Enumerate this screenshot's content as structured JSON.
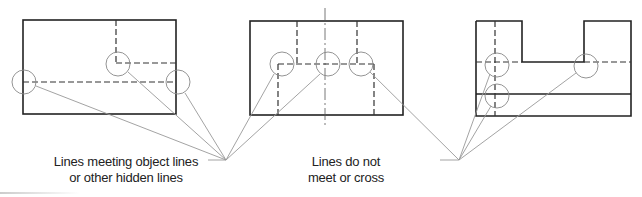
{
  "figure": {
    "views": [
      {
        "name": "view-left",
        "description": "Rectangle with hidden lines meeting object lines"
      },
      {
        "name": "view-middle",
        "description": "Rectangle with centerline and hidden lines meeting other hidden lines"
      },
      {
        "name": "view-right",
        "description": "U-shaped part with hidden lines that do not meet or cross"
      }
    ],
    "labels": {
      "left_line1": "Lines meeting object lines",
      "left_line2": "or other hidden lines",
      "right_line1": "Lines do not",
      "right_line2": "meet or cross"
    },
    "colors": {
      "object_line": "#222222",
      "hidden_line": "#333333",
      "circle": "#888888",
      "leader": "#999999"
    }
  }
}
